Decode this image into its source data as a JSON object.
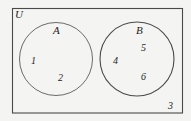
{
  "diagram": {
    "type": "venn-diagram",
    "universe": {
      "label": "U",
      "shape": "rectangle"
    },
    "sets": [
      {
        "id": "A",
        "label": "A",
        "shape": "circle",
        "members": [
          "1",
          "2"
        ]
      },
      {
        "id": "B",
        "label": "B",
        "shape": "circle",
        "members": [
          "4",
          "5",
          "6"
        ]
      }
    ],
    "outside_members": [
      "3"
    ],
    "elements": {
      "e1": "1",
      "e2": "2",
      "e3": "3",
      "e4": "4",
      "e5": "5",
      "e6": "6"
    },
    "colors": {
      "background": "#f4f4f2",
      "stroke": "#5a5a5a",
      "rect_stroke": "#4a4a4a",
      "text": "#1d1d1d"
    }
  }
}
